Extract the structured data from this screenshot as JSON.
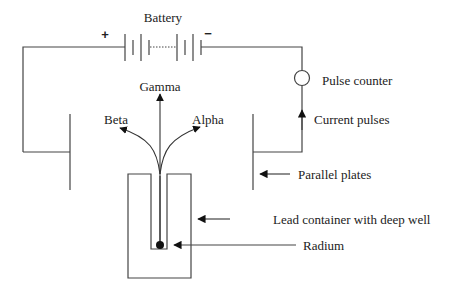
{
  "colors": {
    "line": "#444444",
    "text": "#222222",
    "background": "#ffffff"
  },
  "battery": {
    "label": "Battery",
    "positive": "+",
    "negative": "−"
  },
  "radiation": {
    "gamma": "Gamma",
    "beta": "Beta",
    "alpha": "Alpha"
  },
  "labels": {
    "pulse_counter": "Pulse counter",
    "current_pulses": "Current pulses",
    "parallel_plates": "Parallel plates",
    "lead_container": "Lead container with deep well",
    "radium": "Radium"
  }
}
